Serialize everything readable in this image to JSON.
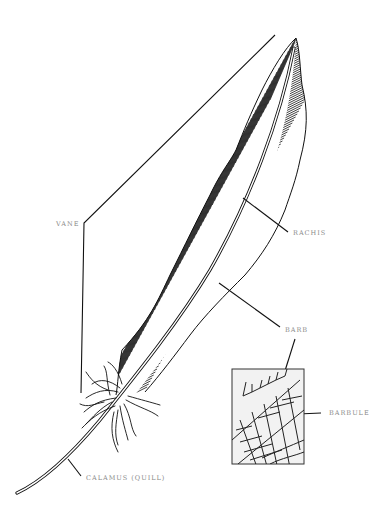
{
  "diagram": {
    "labels": {
      "vane": "VANE",
      "rachis": "RACHIS",
      "barb": "BARB",
      "barbule": "BARBULE",
      "calamus": "CALAMUS (QUILL)"
    },
    "inset": {
      "description": "Magnified detail of barbs and barbules"
    },
    "colors": {
      "ink": "#111111",
      "label": "#8a8a8a",
      "background": "#ffffff",
      "inset_bg": "#f2f2f2"
    }
  }
}
